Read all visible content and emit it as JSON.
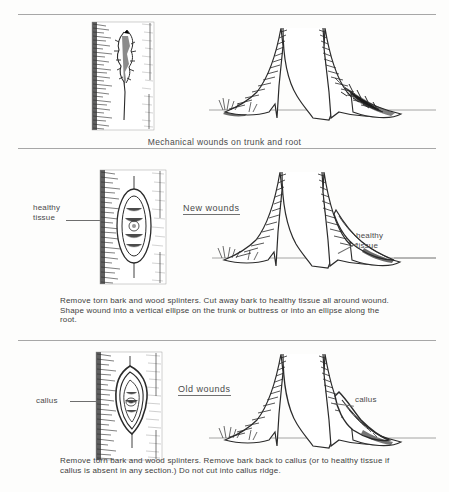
{
  "figure": {
    "ink_color": "#2b2b2b",
    "rule_color": "#a7a7a7",
    "text_color": "#4a4a4a"
  },
  "panels": [
    {
      "id": "mechanical-wounds",
      "caption": "Mechanical  wounds  on  trunk  and  root",
      "heading": "",
      "labels": []
    },
    {
      "id": "new-wounds",
      "heading": "New  wounds",
      "caption": "Remove  torn  bark and wood splinters.  Cut away bark to healthy  tissue all around wound.  Shape wound into a vertical ellipse on the trunk or buttress or  into an ellipse along the root.",
      "labels": [
        {
          "name": "healthy-tissue-left",
          "text": "healthy\ntissue"
        },
        {
          "name": "healthy-tissue-right",
          "text": "healthy\ntissue"
        }
      ]
    },
    {
      "id": "old-wounds",
      "heading": "Old  wounds",
      "caption": "Remove  torn  bark and wood splinters.  Remove bark back to callus (or to healthy  tissue if callus is absent in any section.) Do not cut into callus ridge.",
      "labels": [
        {
          "name": "callus-left",
          "text": "callus"
        },
        {
          "name": "callus-right",
          "text": "callus"
        }
      ]
    }
  ],
  "illustrations": {
    "trunk_wound_ragged": "bark-trunk-with-ragged-wound-illustration",
    "root_buttress_damaged": "tree-base-buttress-roots-damaged-illustration",
    "trunk_wound_ellipse": "bark-trunk-with-vertical-ellipse-wound-illustration",
    "root_buttress_cut": "tree-base-buttress-roots-cut-to-healthy-tissue-illustration",
    "trunk_wound_callus": "bark-trunk-with-callus-ring-wound-illustration",
    "root_buttress_callus": "tree-base-buttress-roots-with-callus-illustration"
  }
}
